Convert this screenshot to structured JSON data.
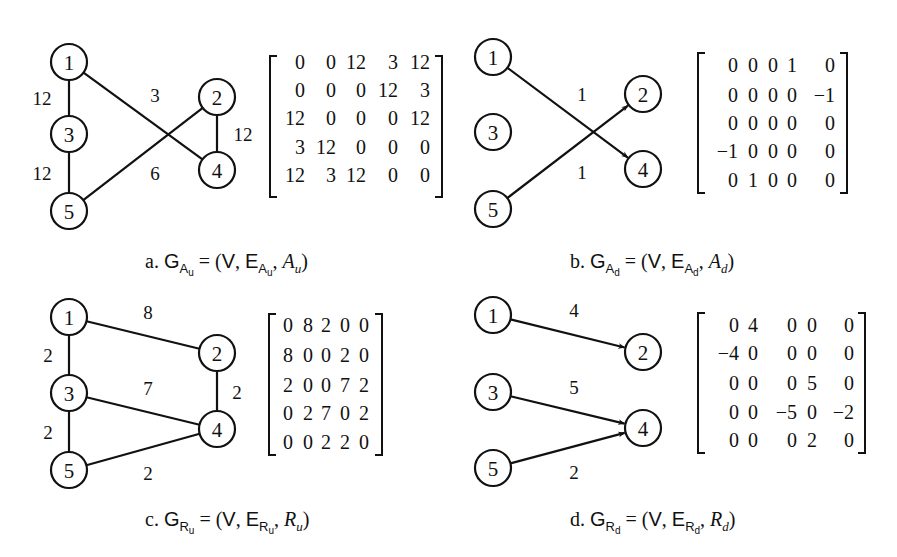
{
  "panels": [
    {
      "id": "a",
      "directed": false,
      "caption": {
        "prefix": "a.",
        "graph": "G",
        "graph_sub": "A",
        "graph_subsub": "u",
        "equals": "= (",
        "v": "V",
        "comma1": ",",
        "edge": "E",
        "edge_sub": "A",
        "edge_subsub": "u",
        "comma2": ",",
        "mat": "A",
        "mat_sub": "u",
        "close": ")"
      },
      "caption_pos": {
        "x": 145,
        "y": 250
      },
      "node_radius": 18,
      "nodes": [
        {
          "id": "1",
          "x": 69,
          "y": 62
        },
        {
          "id": "2",
          "x": 217,
          "y": 97
        },
        {
          "id": "3",
          "x": 69,
          "y": 134
        },
        {
          "id": "4",
          "x": 217,
          "y": 170
        },
        {
          "id": "5",
          "x": 69,
          "y": 211
        }
      ],
      "edges": [
        {
          "from": "1",
          "to": "3",
          "weight": "12",
          "lx": 42,
          "ly": 98
        },
        {
          "from": "3",
          "to": "5",
          "weight": "12",
          "lx": 42,
          "ly": 173
        },
        {
          "from": "1",
          "to": "4",
          "weight": "3",
          "lx": 155,
          "ly": 95
        },
        {
          "from": "5",
          "to": "2",
          "weight": "6",
          "lx": 155,
          "ly": 173
        },
        {
          "from": "2",
          "to": "4",
          "weight": "12",
          "lx": 243,
          "ly": 134
        }
      ],
      "matrix": {
        "bracket": {
          "left": 270,
          "right": 442,
          "top": 56,
          "bottom": 197
        },
        "align": "right",
        "col_x": [
          305,
          336,
          366,
          398,
          430
        ],
        "row_y": [
          62,
          90,
          118,
          147,
          175
        ],
        "rows": [
          [
            "0",
            "0",
            "12",
            "3",
            "12"
          ],
          [
            "0",
            "0",
            "0",
            "12",
            "3"
          ],
          [
            "12",
            "0",
            "0",
            "0",
            "12"
          ],
          [
            "3",
            "12",
            "0",
            "0",
            "0"
          ],
          [
            "12",
            "3",
            "12",
            "0",
            "0"
          ]
        ]
      }
    },
    {
      "id": "b",
      "directed": true,
      "caption": {
        "prefix": "b.",
        "graph": "G",
        "graph_sub": "A",
        "graph_subsub": "d",
        "equals": "= (",
        "v": "V",
        "comma1": ",",
        "edge": "E",
        "edge_sub": "A",
        "edge_subsub": "d",
        "comma2": ",",
        "mat": "A",
        "mat_sub": "d",
        "close": ")"
      },
      "caption_pos": {
        "x": 570,
        "y": 250
      },
      "node_radius": 18,
      "nodes": [
        {
          "id": "1",
          "x": 493,
          "y": 57
        },
        {
          "id": "2",
          "x": 643,
          "y": 94
        },
        {
          "id": "3",
          "x": 493,
          "y": 132
        },
        {
          "id": "4",
          "x": 643,
          "y": 169
        },
        {
          "id": "5",
          "x": 493,
          "y": 209
        }
      ],
      "edges": [
        {
          "from": "1",
          "to": "4",
          "weight": "1",
          "lx": 582,
          "ly": 94
        },
        {
          "from": "5",
          "to": "2",
          "weight": "1",
          "lx": 582,
          "ly": 172
        }
      ],
      "matrix": {
        "bracket": {
          "left": 698,
          "right": 847,
          "top": 53,
          "bottom": 193
        },
        "align": "right",
        "col_x": [
          738,
          758,
          778,
          797,
          835
        ],
        "row_y": [
          65,
          95,
          123,
          151,
          180
        ],
        "rows": [
          [
            "0",
            "0",
            "0",
            "1",
            "0"
          ],
          [
            "0",
            "0",
            "0",
            "0",
            "−1"
          ],
          [
            "0",
            "0",
            "0",
            "0",
            "0"
          ],
          [
            "−1",
            "0",
            "0",
            "0",
            "0"
          ],
          [
            "0",
            "1",
            "0",
            "0",
            "0"
          ]
        ]
      }
    },
    {
      "id": "c",
      "directed": false,
      "caption": {
        "prefix": "c.",
        "graph": "G",
        "graph_sub": "R",
        "graph_subsub": "u",
        "equals": "= (",
        "v": "V",
        "comma1": ",",
        "edge": "E",
        "edge_sub": "R",
        "edge_subsub": "u",
        "comma2": ",",
        "mat": "R",
        "mat_sub": "u",
        "close": ")"
      },
      "caption_pos": {
        "x": 145,
        "y": 508
      },
      "node_radius": 18,
      "nodes": [
        {
          "id": "1",
          "x": 69,
          "y": 317
        },
        {
          "id": "2",
          "x": 217,
          "y": 353
        },
        {
          "id": "3",
          "x": 69,
          "y": 393
        },
        {
          "id": "4",
          "x": 217,
          "y": 429
        },
        {
          "id": "5",
          "x": 69,
          "y": 470
        }
      ],
      "edges": [
        {
          "from": "1",
          "to": "3",
          "weight": "2",
          "lx": 48,
          "ly": 355
        },
        {
          "from": "3",
          "to": "5",
          "weight": "2",
          "lx": 48,
          "ly": 432
        },
        {
          "from": "1",
          "to": "2",
          "weight": "8",
          "lx": 148,
          "ly": 312
        },
        {
          "from": "3",
          "to": "4",
          "weight": "7",
          "lx": 148,
          "ly": 388
        },
        {
          "from": "2",
          "to": "4",
          "weight": "2",
          "lx": 237,
          "ly": 392
        },
        {
          "from": "5",
          "to": "4",
          "weight": "2",
          "lx": 148,
          "ly": 473
        }
      ],
      "matrix": {
        "bracket": {
          "left": 269,
          "right": 382,
          "top": 314,
          "bottom": 455
        },
        "align": "middle",
        "col_x": [
          288,
          308,
          326,
          345,
          364
        ],
        "row_y": [
          325,
          355,
          385,
          413,
          442
        ],
        "rows": [
          [
            "0",
            "8",
            "2",
            "0",
            "0"
          ],
          [
            "8",
            "0",
            "0",
            "2",
            "0"
          ],
          [
            "2",
            "0",
            "0",
            "7",
            "2"
          ],
          [
            "0",
            "2",
            "7",
            "0",
            "2"
          ],
          [
            "0",
            "0",
            "2",
            "2",
            "0"
          ]
        ]
      }
    },
    {
      "id": "d",
      "directed": true,
      "caption": {
        "prefix": "d.",
        "graph": "G",
        "graph_sub": "R",
        "graph_subsub": "d",
        "equals": "= (",
        "v": "V",
        "comma1": ",",
        "edge": "E",
        "edge_sub": "R",
        "edge_subsub": "d",
        "comma2": ",",
        "mat": "R",
        "mat_sub": "d",
        "close": ")"
      },
      "caption_pos": {
        "x": 570,
        "y": 508
      },
      "node_radius": 18,
      "nodes": [
        {
          "id": "1",
          "x": 493,
          "y": 315
        },
        {
          "id": "2",
          "x": 643,
          "y": 352
        },
        {
          "id": "3",
          "x": 493,
          "y": 392
        },
        {
          "id": "4",
          "x": 643,
          "y": 428
        },
        {
          "id": "5",
          "x": 493,
          "y": 468
        }
      ],
      "edges": [
        {
          "from": "1",
          "to": "2",
          "weight": "4",
          "lx": 574,
          "ly": 310
        },
        {
          "from": "3",
          "to": "4",
          "weight": "5",
          "lx": 574,
          "ly": 387
        },
        {
          "from": "5",
          "to": "4",
          "weight": "2",
          "lx": 574,
          "ly": 472
        }
      ],
      "matrix": {
        "bracket": {
          "left": 698,
          "right": 865,
          "top": 313,
          "bottom": 453
        },
        "align": "right",
        "col_x": [
          739,
          758,
          797,
          817,
          854
        ],
        "row_y": [
          325,
          353,
          383,
          412,
          440
        ],
        "rows": [
          [
            "0",
            "4",
            "0",
            "0",
            "0"
          ],
          [
            "−4",
            "0",
            "0",
            "0",
            "0"
          ],
          [
            "0",
            "0",
            "0",
            "5",
            "0"
          ],
          [
            "0",
            "0",
            "−5",
            "0",
            "−2"
          ],
          [
            "0",
            "0",
            "0",
            "2",
            "0"
          ]
        ]
      }
    }
  ]
}
